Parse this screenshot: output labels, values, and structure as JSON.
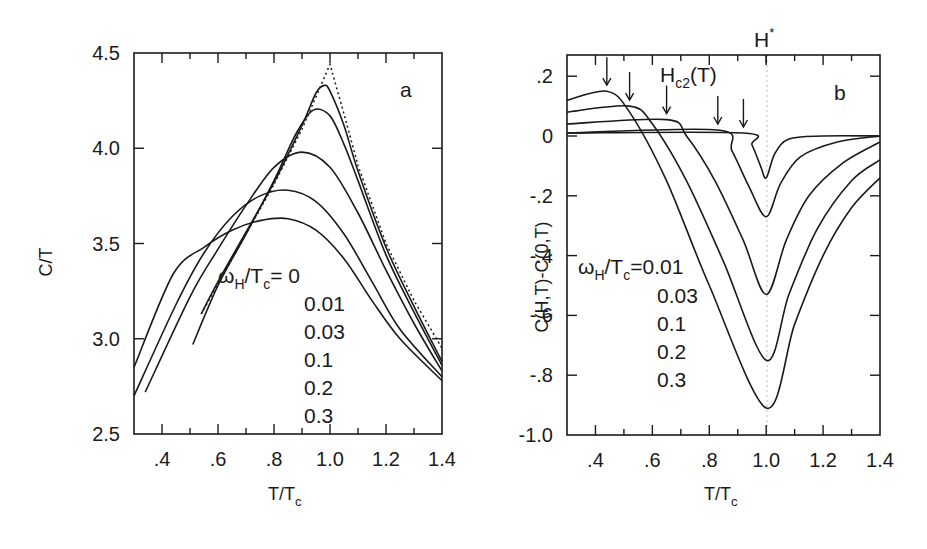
{
  "chart_data": [
    {
      "panel": "a",
      "type": "line",
      "xlabel": "T/T_c",
      "ylabel": "C/T",
      "xlim": [
        0.3,
        1.4
      ],
      "ylim": [
        2.5,
        4.5
      ],
      "x_ticks": [
        ".4",
        ".6",
        ".8",
        "1.0",
        "1.2",
        "1.4"
      ],
      "x_tick_values": [
        0.4,
        0.6,
        0.8,
        1.0,
        1.2,
        1.4
      ],
      "x_minor_step": 0.1,
      "y_ticks": [
        "2.5",
        "3.0",
        "3.5",
        "4.0",
        "4.5"
      ],
      "y_tick_values": [
        2.5,
        3.0,
        3.5,
        4.0,
        4.5
      ],
      "grid": false,
      "panel_label": "a",
      "legend_title": "ω_H/T_c=",
      "legend_entries": [
        "0",
        "0.01",
        "0.03",
        "0.1",
        "0.2",
        "0.3"
      ],
      "series": [
        {
          "name": "0",
          "style": "dotted",
          "x": [
            0.54,
            0.7,
            0.8,
            0.9,
            1.0,
            1.05,
            1.1,
            1.2,
            1.3,
            1.4
          ],
          "y": [
            3.13,
            3.55,
            3.81,
            4.1,
            4.44,
            4.18,
            3.91,
            3.5,
            3.2,
            2.95
          ]
        },
        {
          "name": "0.01",
          "x": [
            0.54,
            0.6,
            0.7,
            0.8,
            0.9,
            0.95,
            0.98,
            1.0,
            1.05,
            1.1,
            1.2,
            1.3,
            1.4
          ],
          "y": [
            3.13,
            3.3,
            3.56,
            3.82,
            4.12,
            4.29,
            4.33,
            4.3,
            4.12,
            3.88,
            3.48,
            3.17,
            2.88
          ]
        },
        {
          "name": "0.03",
          "x": [
            0.51,
            0.6,
            0.7,
            0.8,
            0.88,
            0.94,
            1.0,
            1.05,
            1.1,
            1.2,
            1.3,
            1.4
          ],
          "y": [
            2.97,
            3.28,
            3.55,
            3.83,
            4.08,
            4.2,
            4.17,
            4.02,
            3.83,
            3.44,
            3.14,
            2.86
          ]
        },
        {
          "name": "0.1",
          "x": [
            0.34,
            0.5,
            0.6,
            0.7,
            0.8,
            0.9,
            1.0,
            1.1,
            1.2,
            1.3,
            1.4
          ],
          "y": [
            2.72,
            3.22,
            3.47,
            3.7,
            3.9,
            3.98,
            3.9,
            3.66,
            3.36,
            3.08,
            2.83
          ]
        },
        {
          "name": "0.2",
          "x": [
            0.3,
            0.45,
            0.55,
            0.65,
            0.75,
            0.85,
            0.95,
            1.05,
            1.15,
            1.25,
            1.4
          ],
          "y": [
            2.7,
            3.18,
            3.45,
            3.64,
            3.75,
            3.78,
            3.72,
            3.55,
            3.3,
            3.05,
            2.8
          ]
        },
        {
          "name": "0.3",
          "x": [
            0.3,
            0.44,
            0.55,
            0.65,
            0.75,
            0.85,
            0.95,
            1.05,
            1.15,
            1.25,
            1.4
          ],
          "y": [
            2.85,
            3.34,
            3.48,
            3.57,
            3.62,
            3.63,
            3.57,
            3.42,
            3.2,
            3.0,
            2.78
          ]
        }
      ]
    },
    {
      "panel": "b",
      "type": "line",
      "xlabel": "T/T_c",
      "ylabel": "C(H,T)-C(0,T)",
      "xlim": [
        0.3,
        1.4
      ],
      "ylim": [
        -1.0,
        0.25
      ],
      "x_ticks": [
        ".4",
        ".6",
        ".8",
        "1.0",
        "1.2",
        "1.4"
      ],
      "x_tick_values": [
        0.4,
        0.6,
        0.8,
        1.0,
        1.2,
        1.4
      ],
      "x_minor_step": 0.1,
      "y_ticks": [
        ".2",
        "0",
        "-.2",
        "-.4",
        "-.6",
        "-.8",
        "-1.0"
      ],
      "y_tick_values": [
        0.2,
        0.0,
        -0.2,
        -0.4,
        -0.6,
        -0.8,
        -1.0
      ],
      "grid": false,
      "panel_label": "b",
      "top_annotation": "H*",
      "top_annotation_x": 1.0,
      "arrow_label": "H_c2(T)",
      "arrow_x_positions": [
        0.44,
        0.52,
        0.65,
        0.83,
        0.92
      ],
      "legend_title": "ω_H/T_c=",
      "legend_entries": [
        "0.01",
        "0.03",
        "0.1",
        "0.2",
        "0.3"
      ],
      "series": [
        {
          "name": "0.01",
          "x": [
            0.3,
            0.92,
            0.95,
            0.98,
            1.0,
            1.03,
            1.08,
            1.2,
            1.4
          ],
          "y": [
            0.01,
            0.01,
            -0.03,
            -0.1,
            -0.14,
            -0.06,
            -0.01,
            0.0,
            0.0
          ]
        },
        {
          "name": "0.03",
          "x": [
            0.3,
            0.83,
            0.88,
            0.94,
            1.0,
            1.05,
            1.12,
            1.25,
            1.4
          ],
          "y": [
            0.01,
            0.02,
            -0.05,
            -0.17,
            -0.27,
            -0.16,
            -0.07,
            -0.02,
            0.0
          ]
        },
        {
          "name": "0.1",
          "x": [
            0.3,
            0.65,
            0.72,
            0.82,
            0.92,
            1.0,
            1.07,
            1.15,
            1.27,
            1.4
          ],
          "y": [
            0.04,
            0.055,
            0.0,
            -0.15,
            -0.35,
            -0.53,
            -0.35,
            -0.2,
            -0.09,
            -0.02
          ]
        },
        {
          "name": "0.2",
          "x": [
            0.3,
            0.52,
            0.6,
            0.72,
            0.85,
            1.0,
            1.08,
            1.18,
            1.3,
            1.4
          ],
          "y": [
            0.08,
            0.1,
            0.04,
            -0.15,
            -0.42,
            -0.75,
            -0.53,
            -0.31,
            -0.15,
            -0.08
          ]
        },
        {
          "name": "0.3",
          "x": [
            0.3,
            0.44,
            0.52,
            0.65,
            0.8,
            1.0,
            1.1,
            1.2,
            1.3,
            1.4
          ],
          "y": [
            0.12,
            0.15,
            0.08,
            -0.15,
            -0.5,
            -0.91,
            -0.63,
            -0.4,
            -0.24,
            -0.14
          ]
        }
      ]
    }
  ],
  "panel_a": {
    "ylabel": "C/T",
    "xlabel_main": "T/T",
    "xlabel_sub": "c",
    "letter": "a",
    "legend_omega": "ω",
    "legend_sub_h": "H",
    "legend_slash_t": "/T",
    "legend_sub_c": "c",
    "legend_eq": "= 0",
    "legend_values": [
      "0.01",
      "0.03",
      "0.1",
      "0.2",
      "0.3"
    ]
  },
  "panel_b": {
    "ylabel": "C(H,T)-C(0,T)",
    "xlabel_main": "T/T",
    "xlabel_sub": "c",
    "letter": "b",
    "hstar_main": "H",
    "hstar_sup": "*",
    "hc2_main": "H",
    "hc2_sub": "c2",
    "hc2_tail": "(T)",
    "legend_omega": "ω",
    "legend_sub_h": "H",
    "legend_slash_t": "/T",
    "legend_sub_c": "c",
    "legend_eq": "=0.01",
    "legend_values": [
      "0.03",
      "0.1",
      "0.2",
      "0.3"
    ]
  }
}
